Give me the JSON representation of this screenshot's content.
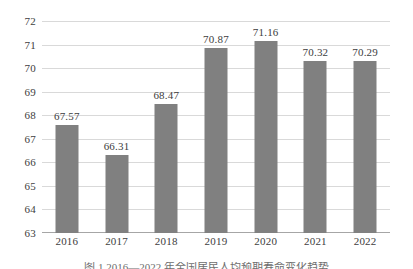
{
  "chart_data": {
    "type": "bar",
    "title": "",
    "subtitle": "",
    "xlabel": "",
    "ylabel": "",
    "categories": [
      "2016",
      "2017",
      "2018",
      "2019",
      "2020",
      "2021",
      "2022"
    ],
    "values": [
      67.57,
      66.31,
      68.47,
      70.87,
      71.16,
      70.32,
      70.29
    ],
    "value_labels": [
      "67.57",
      "66.31",
      "68.47",
      "70.87",
      "71.16",
      "70.32",
      "70.29"
    ],
    "ylim": [
      63,
      72
    ],
    "ytick_labels": [
      "72",
      "71",
      "70",
      "69",
      "68",
      "67",
      "66",
      "65",
      "64",
      "63"
    ],
    "ytick_values": [
      72,
      71,
      70,
      69,
      68,
      67,
      66,
      65,
      64,
      63
    ],
    "grid": true,
    "legend": null,
    "legend_position": "none",
    "series": [
      {
        "name": "",
        "values": [
          67.57,
          66.31,
          68.47,
          70.87,
          71.16,
          70.32,
          70.29
        ],
        "color": "#808080"
      }
    ],
    "colors": {
      "bar": "#808080",
      "gridline": "#d9d9d9",
      "axis": "#a6a6a6",
      "tick_text": "#404040",
      "label_text": "#3d3d3d",
      "background": "#ffffff"
    }
  },
  "caption": {
    "text": "图 1  2016—2022 年全国居民人均预期寿命变化趋势"
  }
}
